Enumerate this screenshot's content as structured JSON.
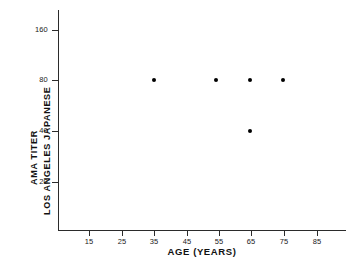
{
  "chart_data": {
    "type": "scatter",
    "title": "",
    "xlabel": "AGE (YEARS)",
    "ylabel_lines": [
      "AMA TITER",
      "LOS ANGELES JAPANESE"
    ],
    "x": [
      35,
      55,
      65,
      75,
      65
    ],
    "y": [
      80,
      80,
      80,
      80,
      40
    ],
    "points": [
      {
        "x": 35,
        "y": 80
      },
      {
        "x": 55,
        "y": 80
      },
      {
        "x": 65,
        "y": 80
      },
      {
        "x": 75,
        "y": 80
      },
      {
        "x": 65,
        "y": 40
      }
    ],
    "xticks": [
      15,
      25,
      35,
      45,
      55,
      65,
      75,
      85
    ],
    "xticklabels": [
      "15",
      "25",
      "35",
      "45",
      "55",
      "65",
      "75",
      "85"
    ],
    "yticks": [
      20,
      40,
      80,
      160
    ],
    "yticklabels": [
      "20",
      "40",
      "80",
      "160"
    ],
    "yscale": "log2",
    "xlim": [
      11,
      97
    ],
    "ylim": [
      12,
      256
    ],
    "grid": false,
    "legend": null,
    "marker": "filled-circle",
    "marker_color": "#000000",
    "background_color": "#ffffff",
    "axis_color": "#2b2b2b"
  },
  "axes": {
    "y_ticks_px": [
      {
        "label": "160",
        "top": 30
      },
      {
        "label": "80",
        "top": 80
      },
      {
        "label": "40",
        "top": 131
      },
      {
        "label": "20",
        "top": 182
      }
    ],
    "x_ticks_px": [
      {
        "label": "15",
        "left": 89
      },
      {
        "label": "25",
        "left": 122
      },
      {
        "label": "35",
        "left": 154
      },
      {
        "label": "45",
        "left": 187
      },
      {
        "label": "55",
        "left": 219
      },
      {
        "label": "65",
        "left": 251
      },
      {
        "label": "75",
        "left": 284
      },
      {
        "label": "85",
        "left": 317
      }
    ],
    "points_px": [
      {
        "left": 154,
        "top": 80
      },
      {
        "left": 216,
        "top": 80
      },
      {
        "left": 250,
        "top": 80
      },
      {
        "left": 283,
        "top": 80
      },
      {
        "left": 250,
        "top": 131
      }
    ]
  }
}
